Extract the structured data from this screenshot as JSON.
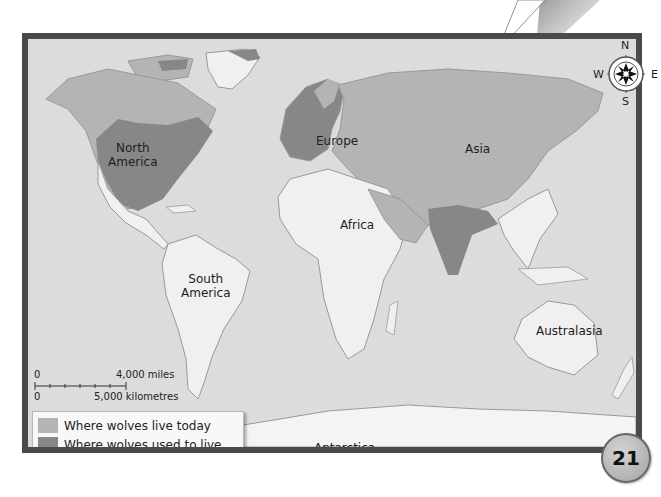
{
  "map": {
    "title": "Wolf range world map",
    "continents": {
      "north_america": "North\nAmerica",
      "south_america": "South\nAmerica",
      "europe": "Europe",
      "asia": "Asia",
      "africa": "Africa",
      "australasia": "Australasia",
      "antarctica": "Antarctica"
    },
    "continent_labels": {
      "north_america_line1": "North",
      "north_america_line2": "America",
      "south_america_line1": "South",
      "south_america_line2": "America",
      "europe": "Europe",
      "asia": "Asia",
      "africa": "Africa",
      "australasia": "Australasia",
      "antarctica": "Antarctica"
    },
    "compass": {
      "north": "N",
      "south": "S",
      "east": "E",
      "west": "W"
    },
    "scale_bar": {
      "zero_top": "0",
      "miles": "4,000 miles",
      "zero_bottom": "0",
      "kilometres": "5,000 kilometres"
    },
    "legend": {
      "items": [
        {
          "label": "Where wolves live today",
          "color": "#b4b4b4"
        },
        {
          "label": "Where wolves used to live",
          "color": "#878787"
        }
      ]
    },
    "colors": {
      "ocean": "#dcdcdc",
      "land_no_wolves": "#f0f0f0",
      "wolves_today": "#b4b4b4",
      "wolves_used_to": "#878787",
      "frame": "#4a4a4a"
    }
  },
  "page": {
    "number": "21"
  }
}
